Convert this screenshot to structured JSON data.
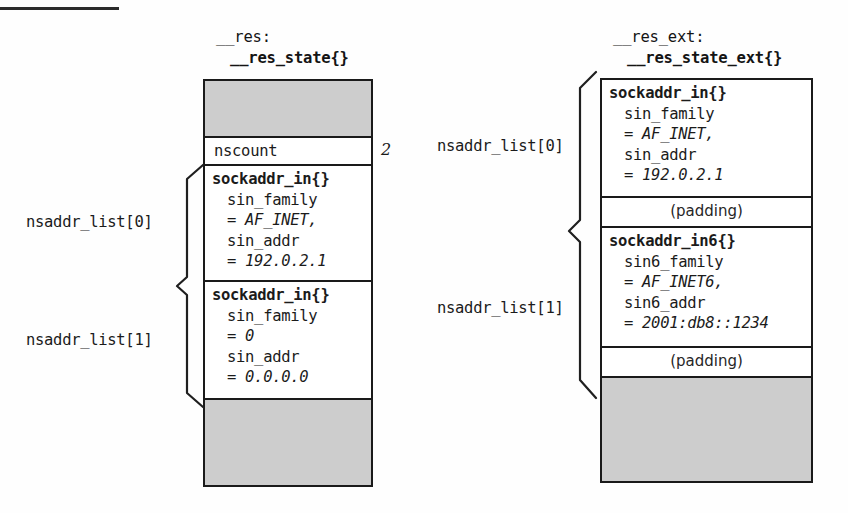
{
  "figure": {
    "top_rule": "horizontal-rule"
  },
  "left_struct": {
    "head_line1": "__res:",
    "head_line2": "__res_state{}",
    "segments": [
      {
        "kind": "gray",
        "text": ""
      },
      {
        "kind": "label",
        "text": "nscount",
        "value": "2"
      },
      {
        "kind": "member",
        "title": "sockaddr_in{}",
        "field1": "sin_family",
        "value1": "= AF_INET,",
        "field2": "sin_addr",
        "value2": "= 192.0.2.1"
      },
      {
        "kind": "member",
        "title": "sockaddr_in{}",
        "field1": "sin_family",
        "value1": "= 0",
        "field2": "sin_addr",
        "value2": "= 0.0.0.0"
      },
      {
        "kind": "gray",
        "text": ""
      }
    ],
    "annotations": [
      {
        "label": "nsaddr_list[0]"
      },
      {
        "label": "nsaddr_list[1]"
      }
    ]
  },
  "right_struct": {
    "head_line1": "__res_ext:",
    "head_line2": "__res_state_ext{}",
    "segments": [
      {
        "kind": "member",
        "title": "sockaddr_in{}",
        "field1": "sin_family",
        "value1": "= AF_INET,",
        "field2": "sin_addr",
        "value2": "= 192.0.2.1"
      },
      {
        "kind": "padding",
        "text": "(padding)"
      },
      {
        "kind": "member",
        "title": "sockaddr_in6{}",
        "field1": "sin6_family",
        "value1": "= AF_INET6,",
        "field2": "sin6_addr",
        "value2": "= 2001:db8::1234"
      },
      {
        "kind": "padding",
        "text": "(padding)"
      },
      {
        "kind": "gray",
        "text": ""
      }
    ],
    "annotations": [
      {
        "label": "nsaddr_list[0]"
      },
      {
        "label": "nsaddr_list[1]"
      }
    ]
  },
  "colors": {
    "ink": "#1a1a1a",
    "gray_fill": "#cdcdcd",
    "paper": "#fefefe"
  }
}
